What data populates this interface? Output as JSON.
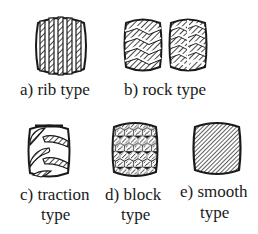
{
  "figure": {
    "items": [
      {
        "id": "a",
        "label": "a)  rib type",
        "line2": ""
      },
      {
        "id": "b",
        "label": "b)  rock type",
        "line2": ""
      },
      {
        "id": "c",
        "label": "c)  traction",
        "line2": "type"
      },
      {
        "id": "d",
        "label": "d)  block",
        "line2": "type"
      },
      {
        "id": "e",
        "label": "e)  smooth",
        "line2": "type"
      }
    ]
  },
  "colors": {
    "ink": "#1a1a1a",
    "background": "#ffffff"
  }
}
